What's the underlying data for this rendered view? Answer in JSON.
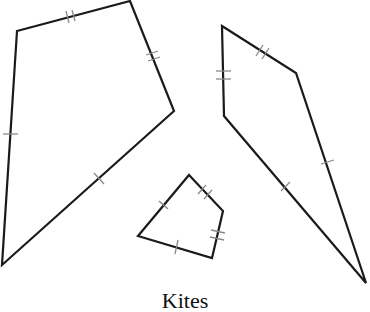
{
  "caption": "Kites",
  "colors": {
    "stroke": "#1a1a1a",
    "tick": "#888888",
    "background": "#ffffff"
  },
  "shapes": [
    {
      "name": "large-left-kite",
      "vertices": [
        [
          17,
          31
        ],
        [
          130,
          1
        ],
        [
          174,
          111
        ],
        [
          2,
          265
        ]
      ],
      "tick_marks": {
        "top-left": 2,
        "top-right": 2,
        "bottom-right": 1,
        "left": 1
      }
    },
    {
      "name": "right-kite",
      "vertices": [
        [
          222,
          26
        ],
        [
          296,
          73
        ],
        [
          366,
          283
        ],
        [
          224,
          116
        ]
      ],
      "tick_marks": {
        "top-right": 2,
        "left-upper": 2,
        "right-long": 1,
        "left-long": 1
      }
    },
    {
      "name": "small-kite",
      "vertices": [
        [
          189,
          175
        ],
        [
          223,
          211
        ],
        [
          212,
          258
        ],
        [
          138,
          236
        ]
      ],
      "tick_marks": {
        "top-right": 2,
        "right": 2,
        "top-left": 1,
        "bottom": 1
      }
    }
  ]
}
